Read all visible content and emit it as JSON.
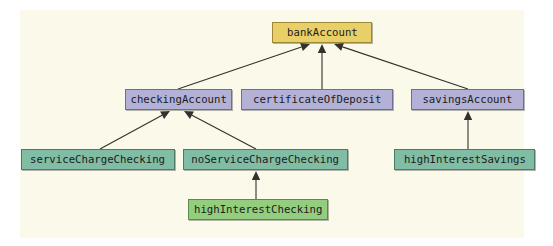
{
  "diagram": {
    "type": "inheritance-hierarchy",
    "canvas_color": "#fbf9ea",
    "page_color": "#ffffff",
    "edge_color": "#33312c",
    "palette": {
      "root": "#e8cf68",
      "mid": "#b3b2d6",
      "leaf": "#81bda4",
      "leaf_light": "#93ce7f"
    },
    "nodes": [
      {
        "id": "bankAccount",
        "label": "bankAccount",
        "kind": "root",
        "level": 0,
        "x": 272,
        "y": 22,
        "w": 100,
        "h": 21
      },
      {
        "id": "checkingAccount",
        "label": "checkingAccount",
        "kind": "mid",
        "level": 1,
        "x": 125,
        "y": 89,
        "w": 107,
        "h": 21
      },
      {
        "id": "certificateOfDeposit",
        "label": "certificateOfDeposit",
        "kind": "mid",
        "level": 1,
        "x": 241,
        "y": 89,
        "w": 152,
        "h": 21
      },
      {
        "id": "savingsAccount",
        "label": "savingsAccount",
        "kind": "mid",
        "level": 1,
        "x": 411,
        "y": 89,
        "w": 113,
        "h": 21
      },
      {
        "id": "serviceChargeChecking",
        "label": "serviceChargeChecking",
        "kind": "leaf",
        "level": 2,
        "x": 21,
        "y": 149,
        "w": 154,
        "h": 21
      },
      {
        "id": "noServiceChargeChecking",
        "label": "noServiceChargeChecking",
        "kind": "leaf",
        "level": 2,
        "x": 183,
        "y": 149,
        "w": 165,
        "h": 21
      },
      {
        "id": "highInterestSavings",
        "label": "highInterestSavings",
        "kind": "leaf",
        "level": 2,
        "x": 394,
        "y": 149,
        "w": 141,
        "h": 21
      },
      {
        "id": "highInterestChecking",
        "label": "highInterestChecking",
        "kind": "leaf_light",
        "level": 3,
        "x": 188,
        "y": 199,
        "w": 140,
        "h": 21
      }
    ],
    "edges": [
      {
        "from": "checkingAccount",
        "to": "bankAccount",
        "x1": 178,
        "y1": 89,
        "x2": 310,
        "y2": 44
      },
      {
        "from": "certificateOfDeposit",
        "to": "bankAccount",
        "x1": 322,
        "y1": 89,
        "x2": 322,
        "y2": 44
      },
      {
        "from": "savingsAccount",
        "to": "bankAccount",
        "x1": 468,
        "y1": 89,
        "x2": 334,
        "y2": 44
      },
      {
        "from": "serviceChargeChecking",
        "to": "checkingAccount",
        "x1": 100,
        "y1": 149,
        "x2": 170,
        "y2": 111
      },
      {
        "from": "noServiceChargeChecking",
        "to": "checkingAccount",
        "x1": 256,
        "y1": 149,
        "x2": 184,
        "y2": 111
      },
      {
        "from": "highInterestSavings",
        "to": "savingsAccount",
        "x1": 468,
        "y1": 149,
        "x2": 468,
        "y2": 111
      },
      {
        "from": "highInterestChecking",
        "to": "noServiceChargeChecking",
        "x1": 256,
        "y1": 199,
        "x2": 256,
        "y2": 171
      }
    ]
  }
}
